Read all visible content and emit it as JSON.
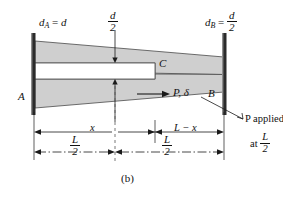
{
  "figure": {
    "caption": "(b)"
  },
  "labels": {
    "dA": {
      "sym": "d",
      "sub": "A",
      "eq": "=",
      "value": "d"
    },
    "dB": {
      "sym": "d",
      "sub": "B",
      "eq": "=",
      "num": "d",
      "den": "2"
    },
    "d_half_top": {
      "num": "d",
      "den": "2"
    },
    "point_A": "A",
    "point_B": "B",
    "point_C": "C",
    "load": "P, δ",
    "note_line1": "P applied",
    "note_line2_prefix": "at",
    "note_line2_num": "L",
    "note_line2_den": "2"
  },
  "dimensions": {
    "x": "x",
    "L_minus_x": "L − x",
    "half_L_left": {
      "num": "L",
      "den": "2"
    },
    "half_L_right": {
      "num": "L",
      "den": "2"
    }
  },
  "colors": {
    "bar_fill": "#cfcfcf",
    "bar_stroke": "#4a4a4a",
    "wall": "#2b2b2b",
    "line": "#1a1a1a",
    "background": "#ffffff"
  },
  "geometry": {
    "left_wall_x": 34,
    "right_wall_x": 224,
    "bar_top_left_y": 41,
    "bar_bot_left_y": 108,
    "bar_top_right_y": 57,
    "bar_bot_right_y": 92,
    "slot_top_y": 63,
    "slot_bot_y": 79,
    "slot_end_x": 155,
    "mid_x": 115,
    "dim_line_y": 132,
    "half_line_y": 152
  }
}
